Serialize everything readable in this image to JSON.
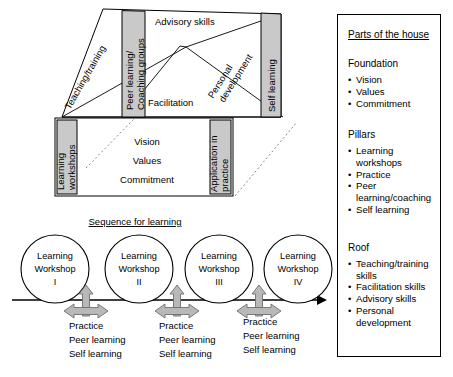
{
  "figure": {
    "type": "house-model-diagram"
  },
  "house": {
    "roof": {
      "left_pillar_label": "Teaching/training",
      "bands": [
        {
          "id": "peer-learning",
          "label_line1": "Peer learning/",
          "label_line2": "Coaching groups",
          "shaded": true
        },
        {
          "id": "self-learning",
          "label_line1": "Self learning",
          "label_line2": "",
          "shaded": true
        }
      ],
      "faces": [
        {
          "id": "advisory-skills",
          "label": "Advisory skills"
        },
        {
          "id": "facilitation",
          "label": "Facilitation"
        },
        {
          "id": "personal-development",
          "label_line1": "Personal",
          "label_line2": "development"
        }
      ]
    },
    "foundation": {
      "left_pillar_line1": "Learning",
      "left_pillar_line2": "workshops",
      "right_pillar_line1": "Application in",
      "right_pillar_line2": "practice",
      "center_values": [
        "Vision",
        "Values",
        "Commitment"
      ]
    }
  },
  "sequence": {
    "title": "Sequence for learning",
    "workshops": [
      {
        "line1": "Learning",
        "line2": "Workshop",
        "line3": "I"
      },
      {
        "line1": "Learning",
        "line2": "Workshop",
        "line3": "II"
      },
      {
        "line1": "Learning",
        "line2": "Workshop",
        "line3": "III"
      },
      {
        "line1": "Learning",
        "line2": "Workshop",
        "line3": "IV"
      }
    ],
    "intervals": [
      {
        "line1": "Practice",
        "line2": "Peer learning",
        "line3": "Self learning"
      },
      {
        "line1": "Practice",
        "line2": "Peer learning",
        "line3": "Self learning"
      },
      {
        "line1": "Practice",
        "line2": "Peer learning",
        "line3": "Self learning"
      }
    ]
  },
  "panel": {
    "title": "Parts of the house",
    "groups": [
      {
        "heading": "Foundation",
        "items": [
          "Vision",
          "Values",
          "Commitment"
        ]
      },
      {
        "heading": "Pillars",
        "items": [
          "Learning workshops",
          "Practice",
          "Peer learning/coaching",
          "Self learning"
        ]
      },
      {
        "heading": "Roof",
        "items": [
          "Teaching/training skills",
          "Facilitation skills",
          "Advisory skills",
          "Personal development"
        ]
      }
    ]
  },
  "colors": {
    "pillar_fill": "#c9c9c9",
    "arrow_fill": "#b8b8b8",
    "line": "#000000",
    "background": "#ffffff"
  }
}
